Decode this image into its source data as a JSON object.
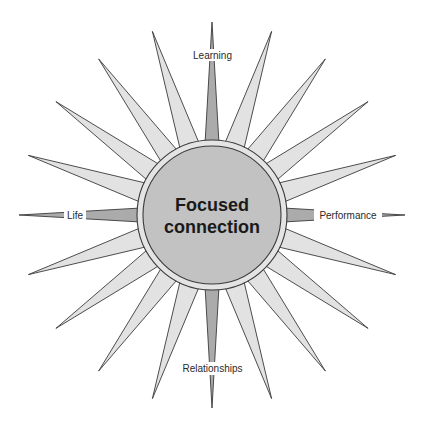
{
  "diagram": {
    "center": {
      "x": 212,
      "y": 215
    },
    "center_title_lines": [
      "Focused",
      "connection"
    ],
    "outer_radius": 75,
    "inner_radius": 69,
    "ray_count": 20,
    "ray_length": 193,
    "ray_half_width_diagonal": 10,
    "ray_half_width_cardinal": 7,
    "colors": {
      "background": "#ffffff",
      "diagonal_ray_fill": "#e2e2e2",
      "cardinal_ray_fill": "#ababab",
      "ring_fill": "#e4e4e4",
      "circle_fill": "#c2c2c2",
      "outline": "#3a3a3a",
      "text": "#1a1a1a"
    },
    "labels": {
      "top": "Learning",
      "right": "Performance",
      "bottom": "Relationships",
      "left": "Life"
    }
  }
}
